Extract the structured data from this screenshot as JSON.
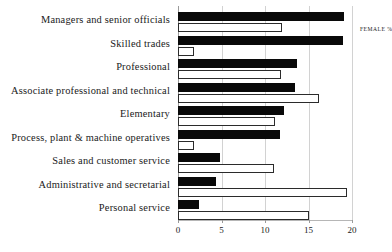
{
  "chart_data": {
    "type": "bar",
    "orientation": "horizontal",
    "title": "",
    "xlabel": "",
    "ylabel": "",
    "xlim": [
      0,
      20
    ],
    "xticks": [
      0,
      5,
      10,
      15,
      20
    ],
    "xtick_labels": [
      "0",
      "5",
      "10",
      "15",
      "20"
    ],
    "grid": true,
    "grid_axis": "x",
    "legend_position": "top-left-inside",
    "categories": [
      "Managers and senior officials",
      "Skilled trades",
      "Professional",
      "Associate professional and technical",
      "Elementary",
      "Process, plant & machine operatives",
      "Sales and customer service",
      "Administrative and secretarial",
      "Personal service"
    ],
    "series": [
      {
        "name": "MALE %",
        "color": "#090909",
        "values": [
          19.1,
          19.0,
          13.7,
          13.4,
          12.2,
          11.7,
          4.8,
          4.4,
          2.4
        ]
      },
      {
        "name": "FEMALE %",
        "color": "#ffffff",
        "edge_color": "#2b2b2b",
        "values": [
          12.0,
          1.8,
          11.8,
          16.2,
          11.1,
          1.8,
          11.0,
          19.4,
          15.0
        ]
      }
    ]
  },
  "legend": {
    "entries": [
      {
        "label": "MALE %"
      },
      {
        "label": "FEMALE %"
      }
    ]
  },
  "colors": {
    "male_fill": "#090909",
    "female_fill": "#ffffff",
    "female_edge": "#2b2b2b",
    "gridline": "#d2d2d2",
    "axis": "#b6b6b6",
    "text": "#1a1a1a",
    "background": "#ffffff"
  }
}
